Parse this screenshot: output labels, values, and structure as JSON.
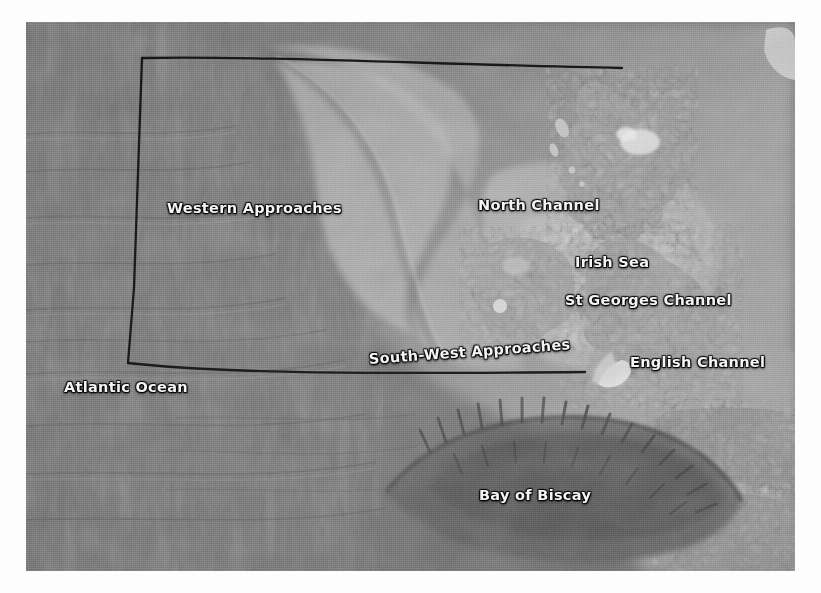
{
  "map": {
    "title": "North-East Atlantic bathymetry — UK and Ireland approaches",
    "kind": "grayscale-satellite-bathymetry",
    "frame": {
      "background_color": "#ffffff",
      "plate_left": 26,
      "plate_top": 22,
      "plate_width": 769,
      "plate_height": 549
    },
    "palette": {
      "deep_ocean": "#6f6f6f",
      "abyssal_plain": "#7b7b7b",
      "continental_slope": "#8f8f8f",
      "shelf": "#a6a6a6",
      "shallow_shelf": "#b8b8b8",
      "land": "#9a9a9a",
      "land_highlight": "#e8e8e8",
      "canyon_dark": "#4a4a4a",
      "boundary_line": "#151515",
      "label_text": "#f4f4f4",
      "label_shadow": "#000000"
    },
    "labels": [
      {
        "id": "western-approaches",
        "text": "Western Approaches",
        "x": 167,
        "y": 200,
        "rotation": 0
      },
      {
        "id": "north-channel",
        "text": "North Channel",
        "x": 478,
        "y": 197,
        "rotation": 0
      },
      {
        "id": "irish-sea",
        "text": "Irish Sea",
        "x": 575,
        "y": 254,
        "rotation": 0
      },
      {
        "id": "st-georges-channel",
        "text": "St Georges Channel",
        "x": 565,
        "y": 292,
        "rotation": 0
      },
      {
        "id": "south-west-approaches",
        "text": "South-West Approaches",
        "x": 369,
        "y": 351,
        "rotation": -4.2
      },
      {
        "id": "english-channel",
        "text": "English Channel",
        "x": 630,
        "y": 354,
        "rotation": 0
      },
      {
        "id": "atlantic-ocean",
        "text": "Atlantic Ocean",
        "x": 64,
        "y": 379,
        "rotation": 0
      },
      {
        "id": "bay-of-biscay",
        "text": "Bay of Biscay",
        "x": 479,
        "y": 487,
        "rotation": 0
      }
    ],
    "boundary": {
      "id": "study-area-boundary",
      "style": "solid black polyline, open on the right side",
      "stroke_color": "#151515",
      "stroke_width": 2.2,
      "vertices_px": [
        [
          142,
          58
        ],
        [
          622,
          68
        ],
        [
          142,
          58
        ],
        [
          128,
          363
        ],
        [
          585,
          372
        ]
      ],
      "segments": [
        {
          "name": "north-edge",
          "from": [
            142,
            58
          ],
          "to": [
            622,
            68
          ]
        },
        {
          "name": "west-edge",
          "from": [
            142,
            58
          ],
          "to": [
            128,
            363
          ]
        },
        {
          "name": "south-edge",
          "from": [
            128,
            363
          ],
          "to": [
            585,
            372
          ]
        }
      ]
    }
  }
}
